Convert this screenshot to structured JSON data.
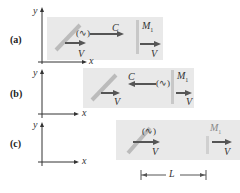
{
  "panels": [
    {
      "id": "a",
      "label": "(a)",
      "velocity": "V",
      "light_speed": "C",
      "mirror": "M",
      "mirror_sub": "1",
      "wave": "(∿)",
      "x_axis": "x",
      "y_axis": "y"
    },
    {
      "id": "b",
      "label": "(b)",
      "velocity": "V",
      "light_speed": "C",
      "mirror": "M",
      "mirror_sub": "1",
      "wave": "(∿)",
      "x_axis": "x",
      "y_axis": "y"
    },
    {
      "id": "c",
      "label": "(c)",
      "velocity": "V",
      "mirror": "M",
      "mirror_sub": "1",
      "wave": "(∿)",
      "x_axis": "x",
      "y_axis": "y",
      "distance": "L"
    }
  ],
  "colors": {
    "box": "#e9e9e9",
    "arrow": "#555555",
    "mirror": "#c8c8c8"
  }
}
